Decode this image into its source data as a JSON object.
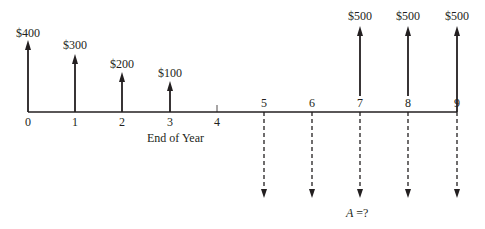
{
  "diagram": {
    "type": "cash-flow-diagram",
    "axis_label": "End of Year",
    "unknown_label_var": "A",
    "unknown_label_rest": " =?",
    "colors": {
      "ink": "#231f20",
      "background": "#ffffff"
    },
    "periods": [
      "0",
      "1",
      "2",
      "3",
      "4",
      "5",
      "6",
      "7",
      "8",
      "9"
    ],
    "receipts": [
      {
        "period": "0",
        "label": "$400",
        "amount": 400
      },
      {
        "period": "1",
        "label": "$300",
        "amount": 300
      },
      {
        "period": "2",
        "label": "$200",
        "amount": 200
      },
      {
        "period": "3",
        "label": "$100",
        "amount": 100
      },
      {
        "period": "7",
        "label": "$500",
        "amount": 500
      },
      {
        "period": "8",
        "label": "$500",
        "amount": 500
      },
      {
        "period": "9",
        "label": "$500",
        "amount": 500
      }
    ],
    "disbursements": [
      {
        "period": "5",
        "label": "A",
        "style": "dashed"
      },
      {
        "period": "6",
        "label": "A",
        "style": "dashed"
      },
      {
        "period": "7",
        "label": "A",
        "style": "dashed"
      },
      {
        "period": "8",
        "label": "A",
        "style": "dashed"
      },
      {
        "period": "9",
        "label": "A",
        "style": "dashed"
      }
    ]
  }
}
